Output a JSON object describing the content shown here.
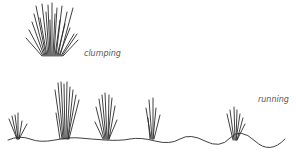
{
  "diagram": {
    "labels": {
      "clumping": "clumping",
      "running": "running"
    },
    "colors": {
      "line": "#2a2a2a",
      "label": "#555555",
      "background": "#ffffff"
    }
  }
}
